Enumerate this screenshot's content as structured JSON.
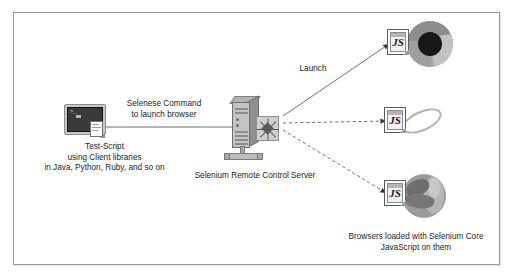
{
  "diagram": {
    "frame": {
      "border_color": "#9a9a9a",
      "background": "#ffffff"
    },
    "nodes": {
      "test_script": {
        "icon": "console-terminal-icon",
        "prompt_text": ">_",
        "caption_lines": [
          "Test-Script",
          "using Client libraries",
          "in Java, Python, Ruby, and so on"
        ]
      },
      "server": {
        "icon": "server-tower-icon",
        "caption": "Selenium Remote Control Server"
      },
      "browsers": {
        "caption_lines": [
          "Browsers loaded with Selenium Core",
          "JavaScript on them"
        ],
        "items": [
          {
            "name": "chrome",
            "icon": "chrome-browser-icon",
            "badge": "JS",
            "badge_label": "js-document-icon"
          },
          {
            "name": "internet-explorer",
            "icon": "internet-explorer-browser-icon",
            "badge": "JS",
            "badge_label": "js-document-icon"
          },
          {
            "name": "firefox",
            "icon": "firefox-browser-icon",
            "badge": "JS",
            "badge_label": "js-document-icon"
          }
        ]
      }
    },
    "connectors": {
      "script_to_server": {
        "label_lines": [
          "Selenese Command",
          "to launch browser"
        ],
        "style": "solid",
        "arrow": false
      },
      "server_to_chrome": {
        "label": "Launch",
        "style": "solid",
        "arrow": true
      },
      "server_to_ie": {
        "label": "",
        "style": "dashed",
        "arrow": true
      },
      "server_to_firefox": {
        "label": "",
        "style": "dashed",
        "arrow": true
      }
    },
    "colors": {
      "line": "#6f6f6f",
      "text": "#1c1c1c",
      "icon_gray_light": "#c4c4c4",
      "icon_gray_mid": "#8f8f8f",
      "icon_gray_dark": "#3a3a3a"
    }
  }
}
